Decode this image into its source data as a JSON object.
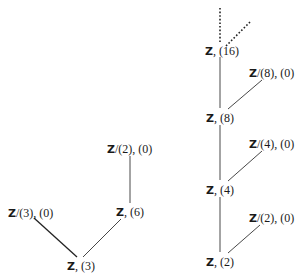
{
  "diagram": {
    "left_tree": {
      "nodes": [
        {
          "id": "Z3_0",
          "ring": "Z",
          "quot": "/(3)",
          "ideal": ", (0)",
          "label": "Z/(3), (0)"
        },
        {
          "id": "Z_6",
          "ring": "Z",
          "quot": "",
          "ideal": ", (6)",
          "label": "Z, (6)"
        },
        {
          "id": "Z2_0a",
          "ring": "Z",
          "quot": "/(2)",
          "ideal": ", (0)",
          "label": "Z/(2), (0)"
        },
        {
          "id": "Z_3",
          "ring": "Z",
          "quot": "",
          "ideal": ", (3)",
          "label": "Z, (3)"
        }
      ],
      "edges": [
        [
          "Z_3",
          "Z3_0"
        ],
        [
          "Z_3",
          "Z_6"
        ],
        [
          "Z_6",
          "Z2_0a"
        ]
      ]
    },
    "right_tree": {
      "nodes": [
        {
          "id": "Z_16",
          "ring": "Z",
          "quot": "",
          "ideal": ", (16)",
          "label": "Z, (16)"
        },
        {
          "id": "Z8_0",
          "ring": "Z",
          "quot": "/(8)",
          "ideal": ", (0)",
          "label": "Z/(8), (0)"
        },
        {
          "id": "Z_8",
          "ring": "Z",
          "quot": "",
          "ideal": ", (8)",
          "label": "Z, (8)"
        },
        {
          "id": "Z4_0",
          "ring": "Z",
          "quot": "/(4)",
          "ideal": ", (0)",
          "label": "Z/(4), (0)"
        },
        {
          "id": "Z_4",
          "ring": "Z",
          "quot": "",
          "ideal": ", (4)",
          "label": "Z, (4)"
        },
        {
          "id": "Z2_0b",
          "ring": "Z",
          "quot": "/(2)",
          "ideal": ", (0)",
          "label": "Z/(2), (0)"
        },
        {
          "id": "Z_2",
          "ring": "Z",
          "quot": "",
          "ideal": ", (2)",
          "label": "Z, (2)"
        }
      ],
      "edges": [
        [
          "Z_2",
          "Z2_0b"
        ],
        [
          "Z_2",
          "Z_4"
        ],
        [
          "Z_4",
          "Z4_0"
        ],
        [
          "Z_4",
          "Z_8"
        ],
        [
          "Z_8",
          "Z8_0"
        ],
        [
          "Z_8",
          "Z_16"
        ]
      ],
      "continuation": "dotted"
    }
  }
}
